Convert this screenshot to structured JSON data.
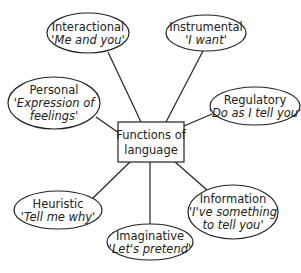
{
  "diagram": {
    "type": "mind-map",
    "center": {
      "lines": [
        "Functions of",
        "language"
      ],
      "x": 151,
      "y": 142,
      "w": 66,
      "h": 40
    },
    "nodes": [
      {
        "id": "interactional",
        "title": "Interactional",
        "subtitle": [
          "'Me and you'"
        ],
        "cx": 88,
        "cy": 33,
        "rx": 41,
        "ry": 20,
        "anchor": [
          108,
          52
        ],
        "end": [
          141,
          122
        ]
      },
      {
        "id": "instrumental",
        "title": "Instrumental",
        "subtitle": [
          "'I want'"
        ],
        "cx": 206,
        "cy": 33,
        "rx": 40,
        "ry": 18,
        "anchor": [
          203,
          51
        ],
        "end": [
          166,
          122
        ]
      },
      {
        "id": "personal",
        "title": "Personal",
        "subtitle": [
          "'Expression of",
          "feelings'"
        ],
        "cx": 54,
        "cy": 103,
        "rx": 46,
        "ry": 26,
        "anchor": [
          96,
          117
        ],
        "end": [
          119,
          133
        ]
      },
      {
        "id": "regulatory",
        "title": "Regulatory",
        "subtitle": [
          "'Do as I tell you'"
        ],
        "cx": 255,
        "cy": 106,
        "rx": 45,
        "ry": 19,
        "anchor": [
          212,
          114
        ],
        "end": [
          184,
          126
        ]
      },
      {
        "id": "heuristic",
        "title": "Heuristic",
        "subtitle": [
          "'Tell me why'"
        ],
        "cx": 58,
        "cy": 210,
        "rx": 44,
        "ry": 19,
        "anchor": [
          92,
          199
        ],
        "end": [
          131,
          161
        ]
      },
      {
        "id": "information",
        "title": "Information",
        "subtitle": [
          "'I've something",
          "to tell you'"
        ],
        "cx": 233,
        "cy": 212,
        "rx": 45,
        "ry": 27,
        "anchor": [
          207,
          190
        ],
        "end": [
          174,
          161
        ]
      },
      {
        "id": "imaginative",
        "title": "Imaginative",
        "subtitle": [
          "'Let's pretend'"
        ],
        "cx": 150,
        "cy": 242,
        "rx": 43,
        "ry": 18,
        "anchor": [
          150,
          224
        ],
        "end": [
          150,
          162
        ]
      }
    ]
  },
  "style": {
    "stroke": "#222222",
    "background": "#ffffff"
  }
}
